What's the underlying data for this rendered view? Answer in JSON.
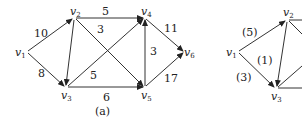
{
  "graph_a": {
    "caption": "(a)",
    "nodes": [
      {
        "id": "v1",
        "label": "v",
        "sub": "1",
        "x": 26,
        "y": 52
      },
      {
        "id": "v2",
        "label": "v",
        "sub": "2",
        "x": 74,
        "y": 18
      },
      {
        "id": "v3",
        "label": "v",
        "sub": "3",
        "x": 66,
        "y": 87
      },
      {
        "id": "v4",
        "label": "v",
        "sub": "4",
        "x": 145,
        "y": 18
      },
      {
        "id": "v5",
        "label": "v",
        "sub": "5",
        "x": 145,
        "y": 87
      },
      {
        "id": "v6",
        "label": "v",
        "sub": "6",
        "x": 185,
        "y": 52
      }
    ],
    "edges": [
      {
        "from": "v1",
        "to": "v2",
        "weight": "10"
      },
      {
        "from": "v1",
        "to": "v3",
        "weight": "8"
      },
      {
        "from": "v2",
        "to": "v3",
        "weight": ""
      },
      {
        "from": "v2",
        "to": "v4",
        "weight": "5"
      },
      {
        "from": "v2",
        "to": "v5",
        "weight": "3"
      },
      {
        "from": "v3",
        "to": "v4",
        "weight": "5"
      },
      {
        "from": "v3",
        "to": "v5",
        "weight": "6"
      },
      {
        "from": "v5",
        "to": "v4",
        "weight": "3"
      },
      {
        "from": "v4",
        "to": "v6",
        "weight": "11"
      },
      {
        "from": "v5",
        "to": "v6",
        "weight": "17"
      }
    ]
  },
  "graph_b": {
    "nodes": [
      {
        "id": "v1",
        "label": "v",
        "sub": "1",
        "x": 237,
        "y": 52
      },
      {
        "id": "v2",
        "label": "v",
        "sub": "2",
        "x": 287,
        "y": 20
      },
      {
        "id": "v3",
        "label": "v",
        "sub": "3",
        "x": 276,
        "y": 88
      }
    ],
    "edges": [
      {
        "from": "v1",
        "to": "v2",
        "weight": "(5)"
      },
      {
        "from": "v1",
        "to": "v3",
        "weight": "(3)"
      },
      {
        "from": "v2",
        "to": "v3",
        "weight": "(1)"
      }
    ]
  }
}
